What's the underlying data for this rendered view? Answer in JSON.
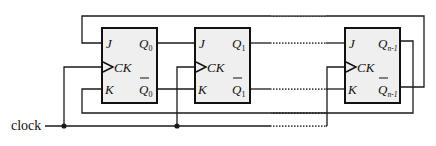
{
  "diagram": {
    "type": "circuit",
    "clock_label": "clock",
    "colors": {
      "wire": "#1a1a1a",
      "box_fill": "#efefef",
      "box_stroke": "#111111",
      "background": "#ffffff"
    },
    "flipflops": [
      {
        "id": "ff0",
        "J": "J",
        "CK": "CK",
        "K": "K",
        "Q": "Q",
        "Q_sub": "0",
        "Qbar": "Q",
        "Qbar_sub": "0"
      },
      {
        "id": "ff1",
        "J": "J",
        "CK": "CK",
        "K": "K",
        "Q": "Q",
        "Q_sub": "1",
        "Qbar": "Q",
        "Qbar_sub": "1"
      },
      {
        "id": "ffn-1",
        "J": "J",
        "CK": "CK",
        "K": "K",
        "Q": "Q",
        "Q_sub": "n-1",
        "Qbar": "Q",
        "Qbar_sub": "n-1"
      }
    ],
    "connections": [
      "Q0 -> J1",
      "Q0bar -> K1",
      "Q1 -> ... -> Jn-1",
      "Q1bar -> ... -> Kn-1",
      "Qn-1 -> K0 (bottom feedback)",
      "Qn-1bar -> J0 (top feedback)",
      "clock -> CK0, CK1, CKn-1"
    ]
  }
}
